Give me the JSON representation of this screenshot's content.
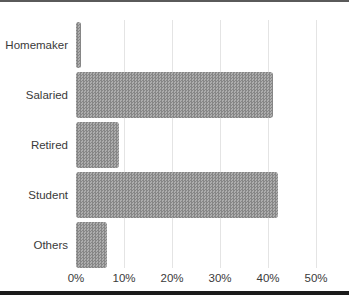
{
  "chart_data": {
    "type": "bar",
    "orientation": "horizontal",
    "title": "",
    "xlabel": "",
    "ylabel": "",
    "categories": [
      "Homemaker",
      "Salaried",
      "Retired",
      "Student",
      "Others"
    ],
    "values": [
      1,
      41,
      9,
      42,
      6.5
    ],
    "value_unit": "%",
    "xlim": [
      0,
      50
    ],
    "x_tick_labels": [
      "0%",
      "10%",
      "20%",
      "30%",
      "40%",
      "50%"
    ],
    "x_tick_values": [
      0,
      10,
      20,
      30,
      40,
      50
    ],
    "grid": "vertical-only",
    "legend": "none",
    "bar_fill_color": "#9a9a9a",
    "bar_pattern": "halftone-dot-texture",
    "gridline_color": "#e4e4e4",
    "text_color": "#3a3a3a"
  },
  "decorations": {
    "top_rule_color": "#5a5a5a",
    "bottom_rule_color": "#1b1b1b"
  }
}
